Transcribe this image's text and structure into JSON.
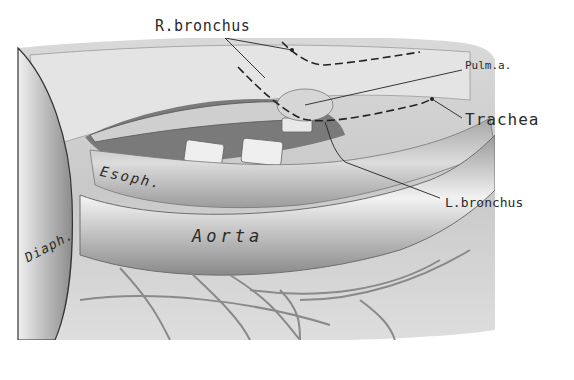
{
  "figure": {
    "type": "anatomical illustration (grayscale)",
    "labels": {
      "r_bronchus": "R.bronchus",
      "pulm_a": "Pulm.a.",
      "trachea": "Trachea",
      "l_bronchus": "L.bronchus",
      "esoph": "Esoph.",
      "aorta": "Aorta",
      "diaph": "Diaph."
    },
    "colors": {
      "background": "#ffffff",
      "tissue_light": "#e6e6e6",
      "tissue_mid": "#b8b8b8",
      "tissue_dark": "#6e6e6e",
      "ink": "#222222"
    }
  }
}
